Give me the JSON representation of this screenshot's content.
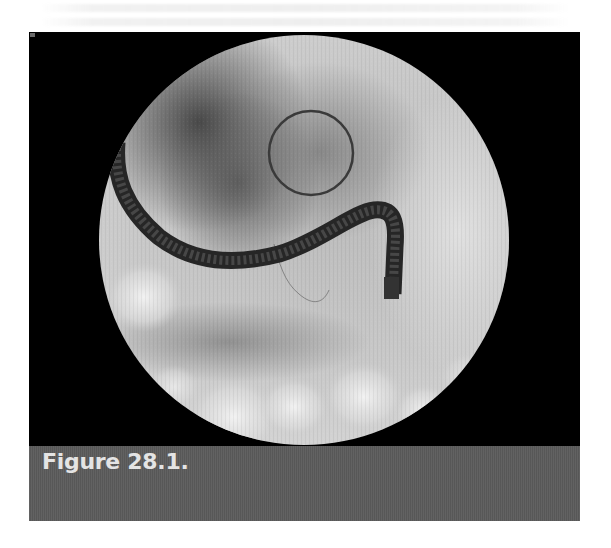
{
  "figure": {
    "caption": "Figure 28.1.",
    "image_description": "Fluoroscopic image showing an endoscope with a circled region of interest",
    "colors": {
      "panel_background": "#000000",
      "caption_background": "#5c5c5c",
      "caption_text": "#e4e4e4",
      "page_background": "#ffffff"
    }
  }
}
